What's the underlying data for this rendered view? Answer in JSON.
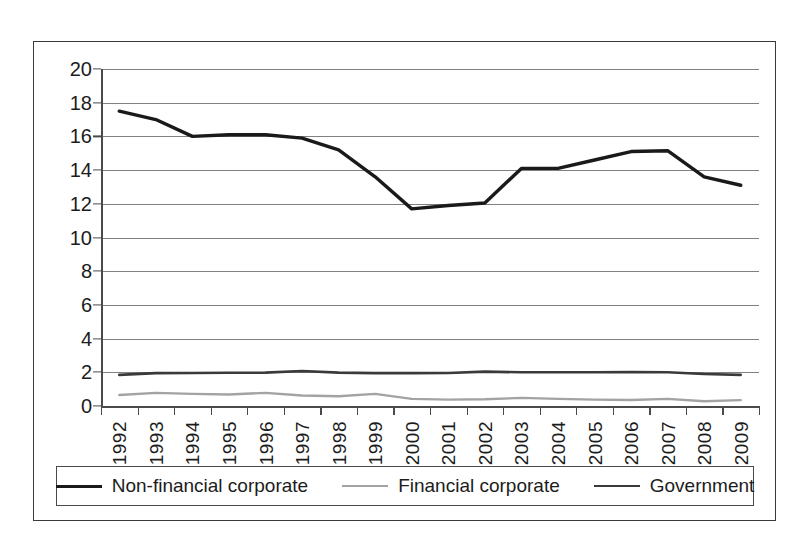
{
  "chart_data": {
    "type": "line",
    "title": "",
    "subtitle": "",
    "xlabel": "",
    "ylabel": "",
    "categories": [
      "1992",
      "1993",
      "1994",
      "1995",
      "1996",
      "1997",
      "1998",
      "1999",
      "2000",
      "2001",
      "2002",
      "2003",
      "2004",
      "2005",
      "2006",
      "2007",
      "2008",
      "2009"
    ],
    "x": [
      1992,
      1993,
      1994,
      1995,
      1996,
      1997,
      1998,
      1999,
      2000,
      2001,
      2002,
      2003,
      2004,
      2005,
      2006,
      2007,
      2008,
      2009
    ],
    "series": [
      {
        "name": "Non-financial corporate",
        "color": "#1a1a1a",
        "width": 3.4,
        "values": [
          17.5,
          17.0,
          16.0,
          16.1,
          16.1,
          15.9,
          15.2,
          13.6,
          11.7,
          11.9,
          12.05,
          14.1,
          14.1,
          14.6,
          15.1,
          15.15,
          13.6,
          13.1
        ]
      },
      {
        "name": "Financial corporate",
        "color": "#a3a3a3",
        "width": 2.4,
        "values": [
          0.65,
          0.78,
          0.72,
          0.68,
          0.78,
          0.62,
          0.58,
          0.72,
          0.42,
          0.38,
          0.4,
          0.48,
          0.42,
          0.38,
          0.36,
          0.42,
          0.28,
          0.35
        ]
      },
      {
        "name": "Government",
        "color": "#3a3a3a",
        "width": 2.6,
        "values": [
          1.85,
          1.95,
          1.96,
          1.97,
          1.98,
          2.08,
          1.98,
          1.95,
          1.95,
          1.96,
          2.04,
          2.0,
          2.0,
          2.0,
          2.01,
          2.0,
          1.9,
          1.85
        ]
      }
    ],
    "ylim": [
      0,
      20
    ],
    "yticks": [
      0,
      2,
      4,
      6,
      8,
      10,
      12,
      14,
      16,
      18,
      20
    ],
    "ytick_labels": [
      "0",
      "2",
      "4",
      "6",
      "8",
      "10",
      "12",
      "14",
      "16",
      "18",
      "20"
    ],
    "grid": true,
    "grid_axis": "y",
    "legend_position": "bottom",
    "legend": [
      "Non-financial corporate",
      "Financial corporate",
      "Government"
    ]
  },
  "legend": {
    "entries": [
      {
        "label": "Non-financial corporate"
      },
      {
        "label": "Financial corporate"
      },
      {
        "label": "Government"
      }
    ]
  }
}
